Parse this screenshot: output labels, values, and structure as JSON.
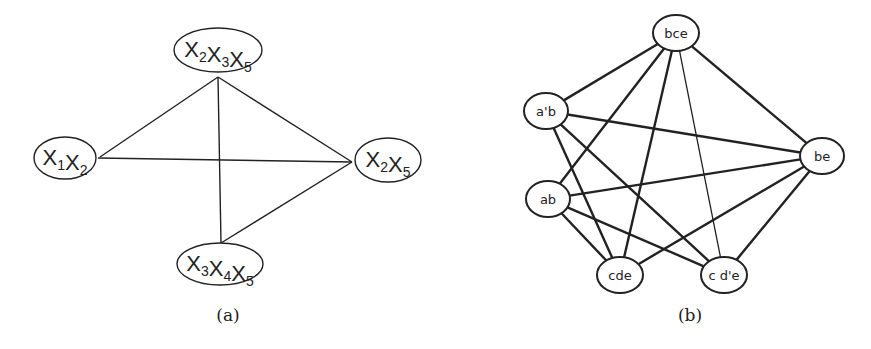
{
  "graph_a": {
    "caption": "(a)",
    "nodes": [
      {
        "id": "x2x3x5",
        "label": "X2X3X5",
        "parts": [
          [
            "X",
            "2"
          ],
          [
            "X",
            "3"
          ],
          [
            "X",
            "5"
          ]
        ],
        "cx": 218,
        "cy": 50,
        "rx": 44,
        "ry": 22
      },
      {
        "id": "x1x2",
        "label": "X1X2",
        "parts": [
          [
            "X",
            "1"
          ],
          [
            "X",
            "2"
          ]
        ],
        "cx": 65,
        "cy": 158,
        "rx": 31,
        "ry": 21
      },
      {
        "id": "x2x5",
        "label": "X2X5",
        "parts": [
          [
            "X",
            "2"
          ],
          [
            "X",
            "5"
          ]
        ],
        "cx": 388,
        "cy": 160,
        "rx": 33,
        "ry": 22
      },
      {
        "id": "x3x4x5",
        "label": "X3X4X5",
        "parts": [
          [
            "X",
            "3"
          ],
          [
            "X",
            "4"
          ],
          [
            "X",
            "5"
          ]
        ],
        "cx": 220,
        "cy": 264,
        "rx": 43,
        "ry": 21
      }
    ],
    "edges": [
      {
        "from": "x2x3x5",
        "to": "x1x2",
        "x1": 218,
        "y1": 77,
        "x2": 100,
        "y2": 157
      },
      {
        "from": "x2x3x5",
        "to": "x2x5",
        "x1": 218,
        "y1": 77,
        "x2": 352,
        "y2": 162
      },
      {
        "from": "x2x3x5",
        "to": "x3x4x5",
        "x1": 218,
        "y1": 77,
        "x2": 221,
        "y2": 243
      },
      {
        "from": "x1x2",
        "to": "x2x5",
        "x1": 98,
        "y1": 158,
        "x2": 352,
        "y2": 162
      },
      {
        "from": "x3x4x5",
        "to": "x2x5",
        "x1": 221,
        "y1": 243,
        "x2": 352,
        "y2": 162
      }
    ]
  },
  "graph_b": {
    "caption": "(b)",
    "nodes": [
      {
        "id": "bce",
        "label": "bce",
        "cx": 676,
        "cy": 33,
        "rx": 23,
        "ry": 18
      },
      {
        "id": "a_prime_b",
        "label": "a'b",
        "cx": 546,
        "cy": 111,
        "rx": 22,
        "ry": 18
      },
      {
        "id": "be",
        "label": "be",
        "cx": 822,
        "cy": 156,
        "rx": 22,
        "ry": 18
      },
      {
        "id": "ab",
        "label": "ab",
        "cx": 548,
        "cy": 199,
        "rx": 22,
        "ry": 18
      },
      {
        "id": "cde",
        "label": "cde",
        "cx": 620,
        "cy": 275,
        "rx": 23,
        "ry": 18
      },
      {
        "id": "c_d_prime_e",
        "label": "c d'e",
        "cx": 724,
        "cy": 275,
        "rx": 23,
        "ry": 18
      }
    ],
    "edges": [
      {
        "from": "bce",
        "to": "a_prime_b",
        "thin": false
      },
      {
        "from": "bce",
        "to": "ab",
        "thin": false
      },
      {
        "from": "bce",
        "to": "cde",
        "thin": false
      },
      {
        "from": "bce",
        "to": "c_d_prime_e",
        "thin": true
      },
      {
        "from": "bce",
        "to": "be",
        "thin": false
      },
      {
        "from": "a_prime_b",
        "to": "be",
        "thin": false
      },
      {
        "from": "a_prime_b",
        "to": "cde",
        "thin": false
      },
      {
        "from": "a_prime_b",
        "to": "c_d_prime_e",
        "thin": false
      },
      {
        "from": "ab",
        "to": "be",
        "thin": false
      },
      {
        "from": "ab",
        "to": "cde",
        "thin": false
      },
      {
        "from": "ab",
        "to": "c_d_prime_e",
        "thin": false
      },
      {
        "from": "be",
        "to": "cde",
        "thin": false
      },
      {
        "from": "be",
        "to": "c_d_prime_e",
        "thin": false
      }
    ]
  }
}
